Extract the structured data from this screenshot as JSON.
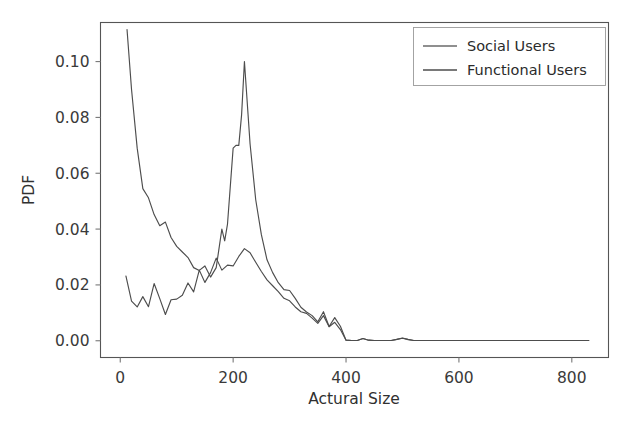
{
  "figure": {
    "background_color": "#ffffff",
    "width": 639,
    "height": 430
  },
  "chart_data": {
    "type": "line",
    "title": "",
    "xlabel": "Actural Size",
    "ylabel": "PDF",
    "xlim": [
      -35,
      865
    ],
    "ylim": [
      -0.006,
      0.114
    ],
    "xticks": [
      0,
      200,
      400,
      600,
      800
    ],
    "xticklabels": [
      "0",
      "200",
      "400",
      "600",
      "800"
    ],
    "yticks": [
      0.0,
      0.02,
      0.04,
      0.06,
      0.08,
      0.1
    ],
    "yticklabels": [
      "0.00",
      "0.02",
      "0.04",
      "0.06",
      "0.08",
      "0.10"
    ],
    "grid": false,
    "legend_position": "upper right",
    "series": [
      {
        "name": "Social Users",
        "color": "#4d4d4d",
        "x": [
          10,
          20,
          30,
          40,
          50,
          60,
          70,
          80,
          90,
          100,
          110,
          120,
          130,
          140,
          150,
          160,
          170,
          180,
          190,
          200,
          210,
          220,
          230,
          240,
          250,
          260,
          270,
          280,
          290,
          300,
          310,
          320,
          330,
          340,
          350,
          360,
          370,
          380,
          390,
          400,
          410,
          420,
          430,
          440,
          450,
          460,
          470,
          480,
          490,
          500,
          510,
          520,
          540,
          560,
          580,
          600,
          650,
          700,
          750,
          800,
          830
        ],
        "y": [
          0.0232,
          0.0142,
          0.0121,
          0.0158,
          0.0122,
          0.0205,
          0.0151,
          0.0094,
          0.0147,
          0.0149,
          0.0163,
          0.0207,
          0.0175,
          0.0253,
          0.0209,
          0.0244,
          0.0296,
          0.0253,
          0.0271,
          0.0268,
          0.0302,
          0.033,
          0.0315,
          0.0281,
          0.0248,
          0.0218,
          0.0197,
          0.0176,
          0.0152,
          0.0143,
          0.0121,
          0.0104,
          0.0098,
          0.0081,
          0.0062,
          0.009,
          0.005,
          0.0066,
          0.004,
          0.0002,
          0.0001,
          0.0001,
          0.0008,
          0.0002,
          0.0001,
          0.0001,
          0.0001,
          0.0001,
          0.0005,
          0.0009,
          0.0004,
          0.0001,
          0.0001,
          0.0001,
          0.0001,
          0.0001,
          0.0001,
          0.0001,
          0.0001,
          0.0001,
          0.0001
        ]
      },
      {
        "name": "Functional Users",
        "color": "#4d4d4d",
        "x": [
          12,
          20,
          30,
          40,
          50,
          60,
          70,
          80,
          90,
          100,
          110,
          120,
          130,
          140,
          150,
          160,
          170,
          180,
          185,
          190,
          200,
          205,
          210,
          215,
          220,
          230,
          240,
          250,
          260,
          270,
          280,
          290,
          300,
          310,
          320,
          330,
          340,
          350,
          360,
          370,
          380,
          390,
          400,
          410,
          420,
          430,
          440,
          450,
          460,
          470,
          480,
          490,
          500,
          510,
          520,
          540,
          560,
          580,
          600,
          650,
          700,
          750,
          800,
          830
        ],
        "y": [
          0.1115,
          0.09,
          0.069,
          0.0545,
          0.0512,
          0.0452,
          0.0412,
          0.0425,
          0.037,
          0.0338,
          0.0318,
          0.0298,
          0.0262,
          0.0252,
          0.0268,
          0.0228,
          0.0262,
          0.04,
          0.0358,
          0.0418,
          0.069,
          0.07,
          0.07,
          0.081,
          0.1,
          0.0705,
          0.0505,
          0.038,
          0.029,
          0.0244,
          0.0208,
          0.0183,
          0.018,
          0.0152,
          0.012,
          0.0103,
          0.009,
          0.0068,
          0.0104,
          0.0051,
          0.0083,
          0.0052,
          0.0002,
          0.0001,
          0.0001,
          0.0008,
          0.0002,
          0.0001,
          0.0001,
          0.0001,
          0.0001,
          0.0005,
          0.001,
          0.0005,
          0.0001,
          0.0001,
          0.0001,
          0.0001,
          0.0001,
          0.0001,
          0.0001,
          0.0001,
          0.0001,
          0.0001
        ]
      }
    ]
  },
  "legend": {
    "entries": [
      {
        "label": "Social Users"
      },
      {
        "label": "Functional Users"
      }
    ]
  },
  "axes": {
    "x_title": "Actural Size",
    "y_title": "PDF"
  }
}
